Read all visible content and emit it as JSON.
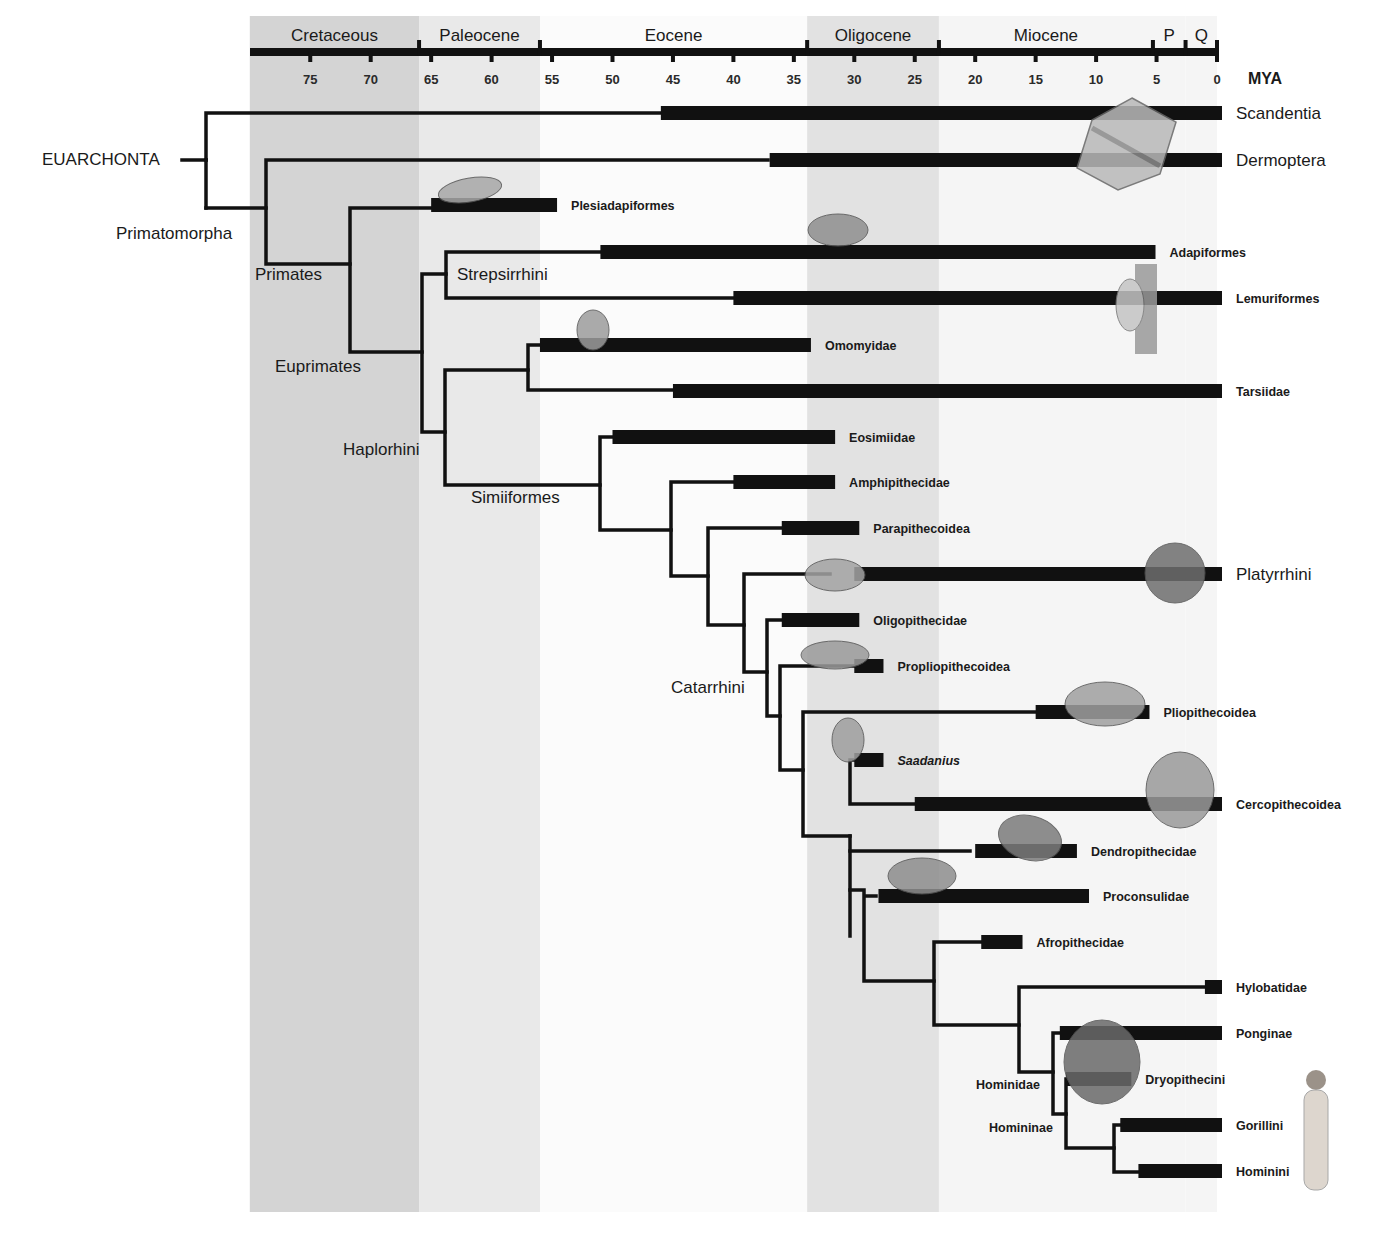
{
  "axis": {
    "unit_label": "MYA",
    "zero_x": 1217,
    "px_per_my": 12.09,
    "ticks": [
      75,
      70,
      65,
      60,
      55,
      50,
      45,
      40,
      35,
      30,
      25,
      20,
      15,
      10,
      5,
      0
    ],
    "periods": [
      {
        "name": "Cretaceous",
        "start": 80,
        "end": 66,
        "shade": "#d4d4d4"
      },
      {
        "name": "Paleocene",
        "start": 66,
        "end": 56,
        "shade": "#e9e9e9"
      },
      {
        "name": "Eocene",
        "start": 56,
        "end": 33.9,
        "shade": "#fbfbfb"
      },
      {
        "name": "Oligocene",
        "start": 33.9,
        "end": 23,
        "shade": "#e2e2e2"
      },
      {
        "name": "Miocene",
        "start": 23,
        "end": 5.3,
        "shade": "#f5f5f5"
      },
      {
        "name": "P",
        "start": 5.3,
        "end": 2.6,
        "shade": "#f5f5f5"
      },
      {
        "name": "Q",
        "start": 2.6,
        "end": 0,
        "shade": "#f5f5f5"
      }
    ]
  },
  "root_label": "EUARCHONTA",
  "clade_labels": [
    {
      "id": "primatomorpha",
      "text": "Primatomorpha"
    },
    {
      "id": "primates",
      "text": "Primates"
    },
    {
      "id": "euprimates",
      "text": "Euprimates"
    },
    {
      "id": "strepsirrhini",
      "text": "Strepsirrhini"
    },
    {
      "id": "haplorhini",
      "text": "Haplorhini"
    },
    {
      "id": "simiiformes",
      "text": "Simiiformes"
    },
    {
      "id": "catarrhini",
      "text": "Catarrhini"
    },
    {
      "id": "hominidae",
      "text": "Hominidae"
    },
    {
      "id": "homininae",
      "text": "Homininae"
    }
  ],
  "taxa": [
    {
      "name": "Scandentia",
      "y": 113,
      "range_start_mya": 46,
      "range_end_mya": 0,
      "size": "big"
    },
    {
      "name": "Dermoptera",
      "y": 160,
      "range_start_mya": 37,
      "range_end_mya": 0,
      "size": "big"
    },
    {
      "name": "Plesiadapiformes",
      "y": 205,
      "range_start_mya": 65,
      "range_end_mya": 55,
      "size": "small"
    },
    {
      "name": "Adapiformes",
      "y": 252,
      "range_start_mya": 51,
      "range_end_mya": 5.5,
      "size": "small"
    },
    {
      "name": "Lemuriformes",
      "y": 298,
      "range_start_mya": 40,
      "range_end_mya": 0,
      "size": "small"
    },
    {
      "name": "Omomyidae",
      "y": 345,
      "range_start_mya": 56,
      "range_end_mya": 34,
      "size": "small"
    },
    {
      "name": "Tarsiidae",
      "y": 391,
      "range_start_mya": 45,
      "range_end_mya": 0,
      "size": "small"
    },
    {
      "name": "Eosimiidae",
      "y": 437,
      "range_start_mya": 50,
      "range_end_mya": 32,
      "size": "small"
    },
    {
      "name": "Amphipithecidae",
      "y": 482,
      "range_start_mya": 40,
      "range_end_mya": 32,
      "size": "small"
    },
    {
      "name": "Parapithecoidea",
      "y": 528,
      "range_start_mya": 36,
      "range_end_mya": 30,
      "size": "small"
    },
    {
      "name": "Platyrrhini",
      "y": 574,
      "range_start_mya": 30,
      "range_end_mya": 0,
      "size": "big"
    },
    {
      "name": "Oligopithecidae",
      "y": 620,
      "range_start_mya": 36,
      "range_end_mya": 30,
      "size": "small"
    },
    {
      "name": "Propliopithecoidea",
      "y": 666,
      "range_start_mya": 30,
      "range_end_mya": 28,
      "size": "small"
    },
    {
      "name": "Pliopithecoidea",
      "y": 712,
      "range_start_mya": 15,
      "range_end_mya": 6,
      "size": "small"
    },
    {
      "name": "Saadanius",
      "y": 760,
      "range_start_mya": 30,
      "range_end_mya": 28,
      "size": "small",
      "italic": true
    },
    {
      "name": "Cercopithecoidea",
      "y": 804,
      "range_start_mya": 25,
      "range_end_mya": 0,
      "size": "small"
    },
    {
      "name": "Dendropithecidae",
      "y": 851,
      "range_start_mya": 20,
      "range_end_mya": 12,
      "size": "small"
    },
    {
      "name": "Proconsulidae",
      "y": 896,
      "range_start_mya": 28,
      "range_end_mya": 11,
      "size": "small"
    },
    {
      "name": "Afropithecidae",
      "y": 942,
      "range_start_mya": 19.5,
      "range_end_mya": 16.5,
      "size": "small"
    },
    {
      "name": "Hylobatidae",
      "y": 987,
      "range_start_mya": 1,
      "range_end_mya": 0,
      "size": "small"
    },
    {
      "name": "Ponginae",
      "y": 1033,
      "range_start_mya": 13,
      "range_end_mya": 0,
      "size": "small"
    },
    {
      "name": "Dryopithecini",
      "y": 1079,
      "range_start_mya": 12.5,
      "range_end_mya": 7.5,
      "size": "small"
    },
    {
      "name": "Gorillini",
      "y": 1125,
      "range_start_mya": 8,
      "range_end_mya": 0,
      "size": "small"
    },
    {
      "name": "Hominini",
      "y": 1171,
      "range_start_mya": 6.5,
      "range_end_mya": 0,
      "size": "small"
    }
  ],
  "illustrations": [
    {
      "id": "colugo",
      "depicts": "gliding colugo (Dermoptera)"
    },
    {
      "id": "plesiadapiform",
      "depicts": "plesiadapiform"
    },
    {
      "id": "adapiform",
      "depicts": "adapiform"
    },
    {
      "id": "lemur",
      "depicts": "lemur on tree trunk"
    },
    {
      "id": "omomyid",
      "depicts": "omomyid with long tail"
    },
    {
      "id": "platyrrhine-left",
      "depicts": "early platyrrhine"
    },
    {
      "id": "platyrrhine-right",
      "depicts": "platyrrhine monkey on branch"
    },
    {
      "id": "propliopithecid",
      "depicts": "propliopithecid"
    },
    {
      "id": "pliopithecid",
      "depicts": "pliopithecid"
    },
    {
      "id": "saadanius",
      "depicts": "Saadanius"
    },
    {
      "id": "baboon",
      "depicts": "cercopithecoid baboon"
    },
    {
      "id": "dendropithecid",
      "depicts": "dendropithecid"
    },
    {
      "id": "proconsul",
      "depicts": "Proconsul"
    },
    {
      "id": "dryopithecus",
      "depicts": "Dryopithecus ape"
    },
    {
      "id": "human",
      "depicts": "walking human"
    }
  ]
}
